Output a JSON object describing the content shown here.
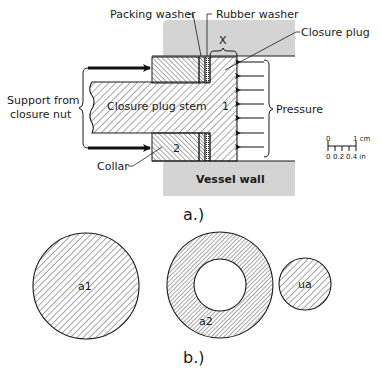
{
  "figure_a": {
    "caption": "a.)",
    "labels": {
      "packing_washer": "Packing washer",
      "rubber_washer": "Rubber washer",
      "closure_plug": "Closure plug",
      "dimension_x": "X",
      "support_line1": "Support from",
      "support_line2": "closure nut",
      "stem": "Closure plug stem",
      "region_1": "1",
      "region_2": "2",
      "collar": "Collar",
      "pressure": "Pressure",
      "vessel_wall": "Vessel wall"
    },
    "scale_bar": {
      "cm_zero": "0",
      "cm_one": "1 cm",
      "in_zero": "0",
      "in_mid": "0.2",
      "in_end": "0.4 in"
    }
  },
  "figure_b": {
    "caption": "b.)",
    "circles": [
      {
        "label": "a1",
        "shape": "solid disk"
      },
      {
        "label": "a2",
        "shape": "annulus"
      },
      {
        "label": "ua",
        "shape": "small solid disk"
      }
    ]
  },
  "colors": {
    "wall_fill": "#d4d4d4",
    "line": "#1a1a1a",
    "background": "#ffffff"
  }
}
